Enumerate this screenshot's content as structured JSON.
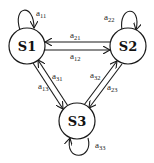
{
  "diagram": {
    "type": "state-transition",
    "states": [
      {
        "id": "S1",
        "label": "S1"
      },
      {
        "id": "S2",
        "label": "S2"
      },
      {
        "id": "S3",
        "label": "S3"
      }
    ],
    "transitions": [
      {
        "from": "S1",
        "to": "S1",
        "label": "a",
        "sub": "11"
      },
      {
        "from": "S2",
        "to": "S2",
        "label": "a",
        "sub": "22"
      },
      {
        "from": "S3",
        "to": "S3",
        "label": "a",
        "sub": "33"
      },
      {
        "from": "S2",
        "to": "S1",
        "label": "a",
        "sub": "21"
      },
      {
        "from": "S1",
        "to": "S2",
        "label": "a",
        "sub": "12"
      },
      {
        "from": "S3",
        "to": "S1",
        "label": "a",
        "sub": "31"
      },
      {
        "from": "S1",
        "to": "S3",
        "label": "a",
        "sub": "13"
      },
      {
        "from": "S3",
        "to": "S2",
        "label": "a",
        "sub": "32"
      },
      {
        "from": "S2",
        "to": "S3",
        "label": "a",
        "sub": "23"
      }
    ]
  }
}
